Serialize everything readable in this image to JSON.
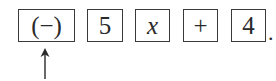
{
  "keys": [
    {
      "label": "(−)"
    },
    {
      "label": "5"
    },
    {
      "label": "x"
    },
    {
      "label": "+"
    },
    {
      "label": "4"
    }
  ],
  "terminator": ".",
  "pointer": {
    "target": "key-0",
    "icon": "up-arrow-icon"
  }
}
